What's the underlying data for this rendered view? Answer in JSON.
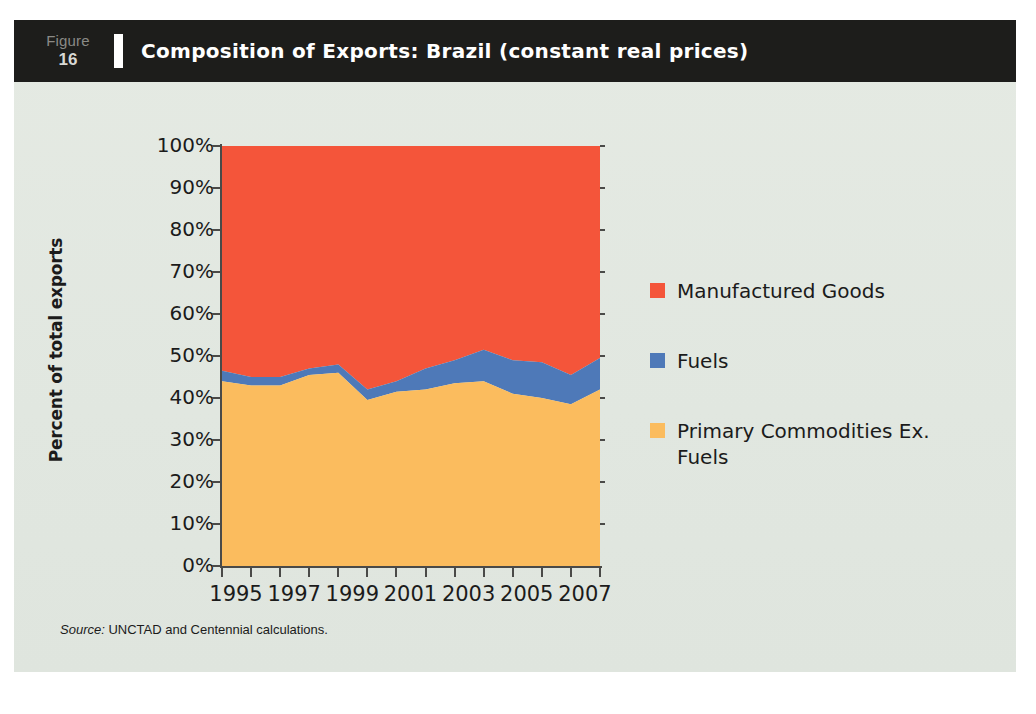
{
  "figure": {
    "word": "Figure",
    "number": "16",
    "title": "Composition of Exports: Brazil (constant real prices)"
  },
  "source": {
    "prefix": "Source:",
    "text": " UNCTAD and Centennial calculations."
  },
  "legend": {
    "items": [
      {
        "label": "Manufactured Goods",
        "color": "#F4553A"
      },
      {
        "label": "Fuels",
        "color": "#4E79B8"
      },
      {
        "label": "Primary Commodities Ex. Fuels",
        "color": "#FBBC5E"
      }
    ]
  },
  "chart_data": {
    "type": "area",
    "stacked": true,
    "title": "Composition of Exports: Brazil (constant real prices)",
    "xlabel": "",
    "ylabel": "Percent of total exports",
    "ylim": [
      0,
      100
    ],
    "ytick_labels": [
      "100%",
      "90%",
      "80%",
      "70%",
      "60%",
      "50%",
      "40%",
      "30%",
      "20%",
      "10%",
      "0%"
    ],
    "ytick_values": [
      100,
      90,
      80,
      70,
      60,
      50,
      40,
      30,
      20,
      10,
      0
    ],
    "grid": false,
    "legend_position": "right",
    "x": [
      1995,
      1996,
      1997,
      1998,
      1999,
      2000,
      2001,
      2002,
      2003,
      2004,
      2005,
      2006,
      2007,
      2008
    ],
    "xtick_labels": [
      "1995",
      "1997",
      "1999",
      "2001",
      "2003",
      "2005",
      "2007"
    ],
    "xtick_values": [
      1995,
      1997,
      1999,
      2001,
      2003,
      2005,
      2007
    ],
    "series": [
      {
        "name": "Primary Commodities Ex. Fuels",
        "color": "#FBBC5E",
        "values": [
          44.0,
          43.0,
          43.0,
          45.5,
          46.0,
          39.5,
          41.5,
          42.0,
          43.5,
          44.0,
          41.0,
          40.0,
          38.5,
          42.0
        ]
      },
      {
        "name": "Fuels",
        "color": "#4E79B8",
        "values": [
          2.5,
          2.0,
          2.0,
          1.5,
          2.0,
          2.5,
          2.5,
          5.0,
          5.5,
          7.5,
          8.0,
          8.5,
          7.0,
          7.5
        ]
      },
      {
        "name": "Manufactured Goods",
        "color": "#F4553A",
        "values": [
          53.5,
          55.0,
          55.0,
          53.0,
          52.0,
          58.0,
          56.0,
          53.0,
          51.0,
          48.5,
          51.0,
          51.5,
          54.5,
          50.5
        ]
      }
    ],
    "cumulative_boundaries": {
      "primary_top": [
        44.0,
        43.0,
        43.0,
        45.5,
        46.0,
        39.5,
        41.5,
        42.0,
        43.5,
        44.0,
        41.0,
        40.0,
        38.5,
        42.0
      ],
      "fuels_top": [
        46.5,
        45.0,
        45.0,
        47.0,
        48.0,
        42.0,
        44.0,
        47.0,
        49.0,
        51.5,
        49.0,
        48.5,
        45.5,
        49.5
      ],
      "manufactured_top": [
        100,
        100,
        100,
        100,
        100,
        100,
        100,
        100,
        100,
        100,
        100,
        100,
        100,
        100
      ]
    }
  }
}
